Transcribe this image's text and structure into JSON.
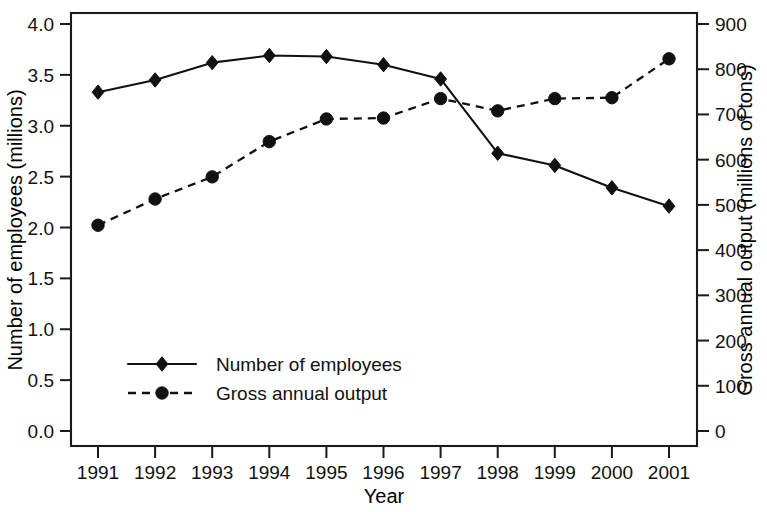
{
  "chart_data": {
    "type": "line",
    "title": "",
    "xlabel": "Year",
    "ylabel": "Number of employees (millions)",
    "y2label": "Gross annual output (millions of tons)",
    "categories": [
      "1991",
      "1992",
      "1993",
      "1994",
      "1995",
      "1996",
      "1997",
      "1998",
      "1999",
      "2000",
      "2001"
    ],
    "x": [
      1991,
      1992,
      1993,
      1994,
      1995,
      1996,
      1997,
      1998,
      1999,
      2000,
      2001
    ],
    "ylim": [
      0.0,
      4.0
    ],
    "y2lim": [
      0,
      900
    ],
    "yticks": [
      "0.0",
      "0.5",
      "1.0",
      "1.5",
      "2.0",
      "2.5",
      "3.0",
      "3.5",
      "4.0"
    ],
    "ytick_values": [
      0.0,
      0.5,
      1.0,
      1.5,
      2.0,
      2.5,
      3.0,
      3.5,
      4.0
    ],
    "y2ticks": [
      "0",
      "100",
      "200",
      "300",
      "400",
      "500",
      "600",
      "700",
      "800",
      "900"
    ],
    "y2tick_values": [
      0,
      100,
      200,
      300,
      400,
      500,
      600,
      700,
      800,
      900
    ],
    "grid": false,
    "legend_position": "lower-left-inside",
    "series": [
      {
        "name": "Number of employees",
        "axis": "left",
        "marker": "diamond",
        "linestyle": "solid",
        "color": "#111111",
        "values": [
          3.33,
          3.45,
          3.62,
          3.69,
          3.68,
          3.6,
          3.46,
          2.73,
          2.61,
          2.39,
          2.21
        ]
      },
      {
        "name": "Gross annual output",
        "axis": "right",
        "marker": "circle",
        "linestyle": "dashed",
        "color": "#111111",
        "values": [
          455,
          513,
          562,
          640,
          690,
          692,
          735,
          708,
          735,
          737,
          823
        ]
      }
    ]
  },
  "legend": {
    "items": [
      {
        "label": "Number of employees",
        "marker": "diamond",
        "linestyle": "solid"
      },
      {
        "label": "Gross annual output",
        "marker": "circle",
        "linestyle": "dashed"
      }
    ]
  }
}
